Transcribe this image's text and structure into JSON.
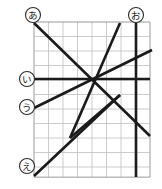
{
  "figure": {
    "type": "geometry-grid-diagram",
    "background_color": "#ffffff",
    "grid": {
      "line_color": "#bfbfbf",
      "border_color": "#9a9a9a",
      "x0": 34,
      "y0": 22,
      "cell": 14.5,
      "cols": 8,
      "rows": 10.7
    },
    "line_color": "#1a1a1a",
    "labels": [
      {
        "id": "a",
        "text": "あ",
        "cx": 33,
        "cy": 15,
        "r": 7.5
      },
      {
        "id": "o",
        "text": "お",
        "cx": 136,
        "cy": 15,
        "r": 7.5
      },
      {
        "id": "i",
        "text": "い",
        "cx": 27,
        "cy": 79,
        "r": 7.5
      },
      {
        "id": "u",
        "text": "う",
        "cx": 27,
        "cy": 107,
        "r": 7.5
      },
      {
        "id": "e",
        "text": "え",
        "cx": 27,
        "cy": 166,
        "r": 7.5
      }
    ],
    "segments": [
      {
        "id": "line-a",
        "name": "diagonal-from-a",
        "x1": 34,
        "y1": 23,
        "x2": 150,
        "y2": 136
      },
      {
        "id": "line-e",
        "name": "diagonal-from-e",
        "x1": 34,
        "y1": 176,
        "x2": 120,
        "y2": 95
      },
      {
        "id": "line-up-left",
        "name": "diagonal-up-right-to-top",
        "x1": 70,
        "y1": 138,
        "x2": 120,
        "y2": 95
      },
      {
        "id": "line-top-right",
        "name": "diagonal-top-right-descending",
        "x1": 120,
        "y1": 23,
        "x2": 70,
        "y2": 138
      },
      {
        "id": "line-u",
        "name": "diagonal-from-u",
        "x1": 34,
        "y1": 108,
        "x2": 152,
        "y2": 50
      },
      {
        "id": "line-i",
        "name": "horizontal-from-i",
        "x1": 34,
        "y1": 79,
        "x2": 150,
        "y2": 79
      },
      {
        "id": "line-o",
        "name": "vertical-from-o",
        "x1": 136,
        "y1": 23,
        "x2": 136,
        "y2": 177
      }
    ]
  }
}
